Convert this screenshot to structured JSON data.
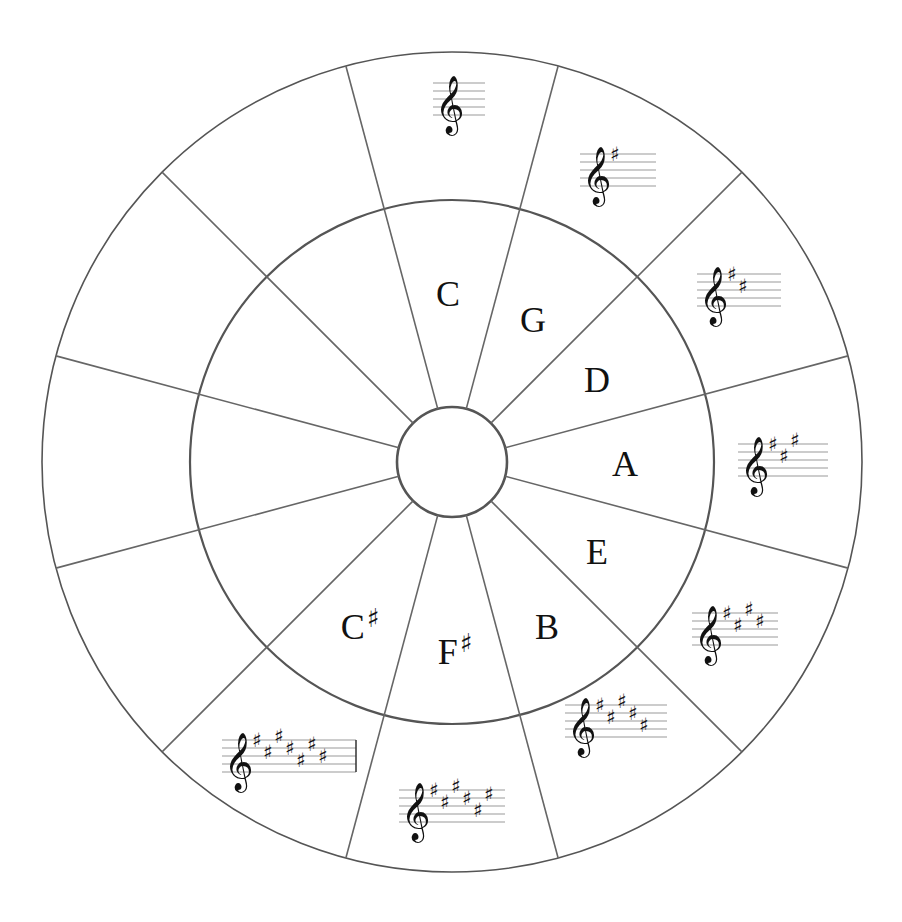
{
  "diagram": {
    "center": {
      "x": 452,
      "y": 462
    },
    "radii": {
      "outer": 410,
      "middle": 262,
      "inner": 55
    },
    "sector_count": 12,
    "colors": {
      "line": "#666666",
      "ring": "#555555",
      "text": "#111111",
      "staff": "#999999",
      "background": "#ffffff"
    }
  },
  "keys": [
    {
      "name": "C",
      "letter": "C",
      "accidental": "",
      "sharps": 0,
      "label_pos": {
        "x": 449,
        "y": 292
      },
      "staff": {
        "x": 433,
        "y": 83,
        "width": 52
      }
    },
    {
      "name": "G",
      "letter": "G",
      "accidental": "",
      "sharps": 1,
      "label_pos": {
        "x": 534,
        "y": 318
      },
      "staff": {
        "x": 580,
        "y": 154,
        "width": 76
      }
    },
    {
      "name": "D",
      "letter": "D",
      "accidental": "",
      "sharps": 2,
      "label_pos": {
        "x": 598,
        "y": 378
      },
      "staff": {
        "x": 697,
        "y": 274,
        "width": 84
      }
    },
    {
      "name": "A",
      "letter": "A",
      "accidental": "",
      "sharps": 3,
      "label_pos": {
        "x": 626,
        "y": 462
      },
      "staff": {
        "x": 738,
        "y": 444,
        "width": 90
      }
    },
    {
      "name": "E",
      "letter": "E",
      "accidental": "",
      "sharps": 4,
      "label_pos": {
        "x": 598,
        "y": 550
      },
      "staff": {
        "x": 692,
        "y": 613,
        "width": 86
      }
    },
    {
      "name": "B",
      "letter": "B",
      "accidental": "",
      "sharps": 5,
      "label_pos": {
        "x": 548,
        "y": 625
      },
      "staff": {
        "x": 565,
        "y": 705,
        "width": 102
      }
    },
    {
      "name": "F#",
      "letter": "F",
      "accidental": "♯",
      "sharps": 6,
      "label_pos": {
        "x": 455,
        "y": 650
      },
      "staff": {
        "x": 399,
        "y": 790,
        "width": 106
      }
    },
    {
      "name": "C#",
      "letter": "C",
      "accidental": "♯",
      "sharps": 7,
      "label_pos": {
        "x": 360,
        "y": 625
      },
      "staff": {
        "x": 222,
        "y": 740,
        "width": 134
      }
    },
    {
      "name": "empty-8",
      "letter": "",
      "accidental": "",
      "sharps": null
    },
    {
      "name": "empty-9",
      "letter": "",
      "accidental": "",
      "sharps": null
    },
    {
      "name": "empty-10",
      "letter": "",
      "accidental": "",
      "sharps": null
    },
    {
      "name": "empty-11",
      "letter": "",
      "accidental": "",
      "sharps": null
    }
  ],
  "symbols": {
    "clef": "𝄞",
    "sharp": "♯"
  },
  "sharp_order": [
    "F",
    "C",
    "G",
    "D",
    "A",
    "E",
    "B"
  ]
}
